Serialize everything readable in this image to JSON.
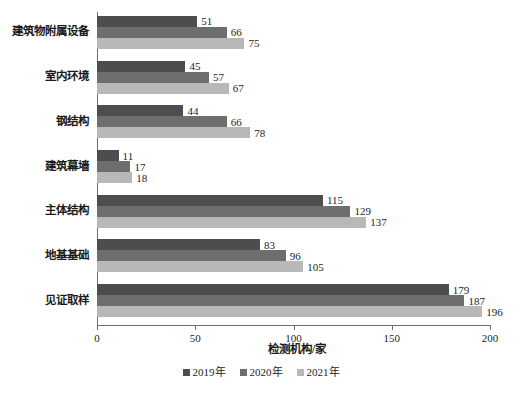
{
  "chart_data": {
    "type": "bar",
    "orientation": "horizontal",
    "title": "",
    "xlabel": "检测机构/家",
    "ylabel": "",
    "xlim": [
      0,
      200
    ],
    "xticks": [
      0,
      50,
      100,
      150,
      200
    ],
    "grid": false,
    "legend_position": "bottom",
    "categories": [
      "建筑物附属设备",
      "室内环境",
      "钢结构",
      "建筑幕墙",
      "主体结构",
      "地基基础",
      "见证取样"
    ],
    "series": [
      {
        "name": "2019年",
        "color": "#4d4d4d",
        "values": [
          51,
          45,
          44,
          11,
          115,
          83,
          179
        ]
      },
      {
        "name": "2020年",
        "color": "#6e6e6e",
        "values": [
          66,
          57,
          66,
          17,
          129,
          96,
          187
        ]
      },
      {
        "name": "2021年",
        "color": "#b8b8b8",
        "values": [
          75,
          67,
          78,
          18,
          137,
          105,
          196
        ]
      }
    ]
  },
  "axis": {
    "line_color": "#6f6f6f"
  }
}
